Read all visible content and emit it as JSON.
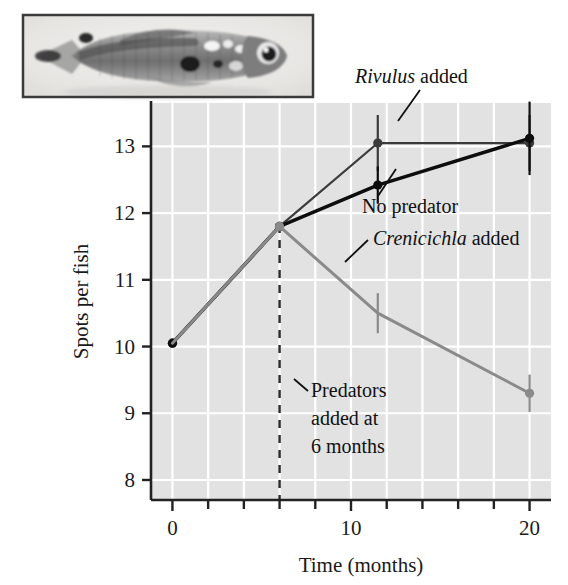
{
  "figure": {
    "inset_caption": "guppy-photograph",
    "inset_alt": "Photograph of a male guppy showing spots"
  },
  "chart_data": {
    "type": "line",
    "title": "",
    "xlabel": "Time (months)",
    "ylabel": "Spots per fish",
    "xlim": [
      -1.2,
      21.2
    ],
    "ylim": [
      7.7,
      13.65
    ],
    "xticks": [
      0,
      2,
      4,
      6,
      8,
      10,
      12,
      14,
      16,
      18,
      20
    ],
    "xticklabels": [
      "0",
      "",
      "",
      "",
      "",
      "10",
      "",
      "",
      "",
      "",
      "20"
    ],
    "yticks": [
      8,
      9,
      10,
      11,
      12,
      13
    ],
    "yticklabels": [
      "8",
      "9",
      "10",
      "11",
      "12",
      "13"
    ],
    "grid": true,
    "grid_color": "#ffffff",
    "plot_bg": "#e2e2e2",
    "legend_position": "inline-annotations",
    "series": [
      {
        "name": "Rivulus added",
        "label_italic_prefix": "Rivulus",
        "label_rest": " added",
        "color": "#3b3b3b",
        "linewidth": 2.2,
        "x": [
          0,
          6,
          11.5,
          20
        ],
        "values": [
          10.05,
          11.8,
          13.05,
          13.05
        ],
        "errors": [
          0,
          0,
          0.42,
          0.42
        ],
        "markers": [
          true,
          true,
          true,
          true
        ]
      },
      {
        "name": "No predator",
        "label_italic_prefix": "",
        "label_rest": "No predator",
        "color": "#0d0d0d",
        "linewidth": 3.4,
        "x": [
          0,
          6,
          11.5,
          20
        ],
        "values": [
          10.05,
          11.8,
          12.42,
          13.12
        ],
        "errors": [
          0,
          0,
          0.28,
          0.55
        ],
        "markers": [
          true,
          true,
          true,
          true
        ]
      },
      {
        "name": "Crenicichla added",
        "label_italic_prefix": "Crenicichla",
        "label_rest": " added",
        "color": "#8a8a8a",
        "linewidth": 3.0,
        "x": [
          0,
          6,
          11.5,
          20
        ],
        "values": [
          10.05,
          11.8,
          10.5,
          9.3
        ],
        "errors": [
          0,
          0,
          0.3,
          0.28
        ],
        "markers": [
          false,
          true,
          false,
          true
        ]
      }
    ],
    "annotations": [
      {
        "id": "rivulus-annotation",
        "italic_text": "Rivulus",
        "plain_text": " added",
        "x_text": 355,
        "y_text": 83
      },
      {
        "id": "no-predator-annotation",
        "italic_text": "",
        "plain_text": "No predator",
        "x_text": 362,
        "y_text": 213
      },
      {
        "id": "crenicichla-annotation",
        "italic_text": "Crenicichla",
        "plain_text": " added",
        "x_text": 373,
        "y_text": 245
      }
    ],
    "vline": {
      "id": "predators-added-line",
      "x": 6,
      "style": "dashed",
      "color": "#2b2b2b",
      "label_lines": [
        "Predators",
        "added at",
        "6 months"
      ]
    }
  }
}
